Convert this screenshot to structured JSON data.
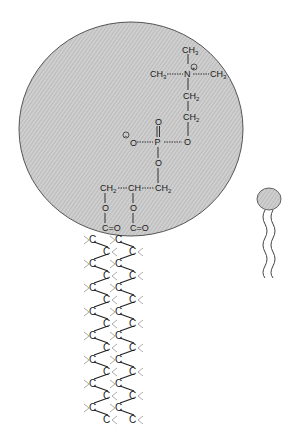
{
  "figure": {
    "head_group": {
      "fill_color": "#c8c8c8",
      "outline_color": "#555555",
      "labels": {
        "ch3_top": "CH",
        "ch3_top_sub": "3",
        "ch3_left": "CH",
        "ch3_left_sub": "3",
        "ch3_right": "CH",
        "ch3_right_sub": "3",
        "nitrogen": "N",
        "positive_charge": "+",
        "ch2_upper": "CH",
        "ch2_upper_sub": "2",
        "ch2_lower": "CH",
        "ch2_lower_sub": "2",
        "ester_o_right": "O",
        "phosphorus": "P",
        "phosphoryl_o": "O",
        "anionic_o": "O",
        "negative_charge": "−",
        "ester_o_below": "O",
        "glycerol_ch2_left": "CH",
        "glycerol_ch2_left_sub": "2",
        "glycerol_ch": "CH",
        "glycerol_ch2_right": "CH",
        "glycerol_ch2_right_sub": "2",
        "ester_o_left_chain": "O",
        "ester_o_right_chain": "O",
        "carbonyl_left": "C=O",
        "carbonyl_right": "C=O"
      }
    },
    "tails": {
      "carbon_label": "C",
      "chain_count": 2,
      "carbons_per_chain": 16
    },
    "schematic_symbol": {
      "head_fill": "#c8c8c8",
      "tail_count": 2
    }
  }
}
